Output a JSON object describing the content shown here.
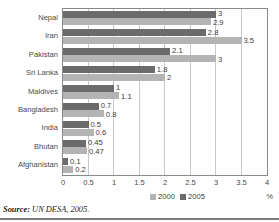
{
  "chart_data": {
    "type": "bar",
    "orientation": "horizontal",
    "title": "",
    "xlabel": "%",
    "ylabel": "",
    "categories": [
      "Nepal",
      "Iran",
      "Pakistan",
      "Sri Lanka",
      "Maldives",
      "Bangladesh",
      "India",
      "Bhutan",
      "Afghanistan"
    ],
    "series": [
      {
        "name": "2000",
        "color": "#b4b4b4",
        "values": [
          2.9,
          3.5,
          3,
          2,
          1.1,
          0.8,
          0.6,
          0.47,
          0.2
        ],
        "labels": [
          "2.9",
          "3.5",
          "3",
          "2",
          "1.1",
          "0.8",
          "0.6",
          "0.47",
          "0.2"
        ]
      },
      {
        "name": "2005",
        "color": "#6b6b6b",
        "values": [
          3,
          2.8,
          2.1,
          1.8,
          1,
          0.7,
          0.5,
          0.45,
          0.1
        ],
        "labels": [
          "3",
          "2.8",
          "2.1",
          "1.8",
          "1",
          "0.7",
          "0.5",
          "0.45",
          "0.1"
        ]
      }
    ],
    "xlim": [
      0,
      4
    ],
    "xticks": [
      0,
      0.5,
      1,
      1.5,
      2,
      2.5,
      3,
      3.5,
      4
    ],
    "xtick_labels": [
      "0",
      "0.5",
      "1",
      "1.5",
      "2",
      "2.5",
      "3",
      "3.5",
      "4"
    ],
    "grid": "vertical",
    "legend_position": "bottom-center",
    "legend": [
      "2000",
      "2005"
    ]
  },
  "axis": {
    "unit_label": "%"
  },
  "source": {
    "key": "Source:",
    "value": "UN DESA, 2005."
  }
}
